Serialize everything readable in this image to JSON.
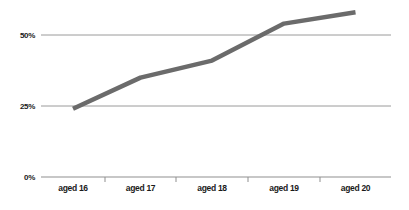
{
  "chart_data": {
    "type": "line",
    "title": "",
    "xlabel": "",
    "ylabel": "",
    "categories": [
      "aged 16",
      "aged 17",
      "aged 18",
      "aged 19",
      "aged 20"
    ],
    "series": [
      {
        "name": "percentage",
        "values": [
          24,
          35,
          41,
          54,
          58
        ]
      }
    ],
    "y_ticks": [
      {
        "value": 0,
        "label": "0%"
      },
      {
        "value": 25,
        "label": "25%"
      },
      {
        "value": 50,
        "label": "50%"
      }
    ],
    "ylim": [
      0,
      62
    ],
    "grid": true,
    "legend": false,
    "colors": {
      "line": "#6b6b6b",
      "gridline": "#9a9a9a",
      "axis": "#8f8f8f",
      "tick": "#8f8f8f",
      "label": "#1a1a1a",
      "background": "#ffffff"
    }
  }
}
